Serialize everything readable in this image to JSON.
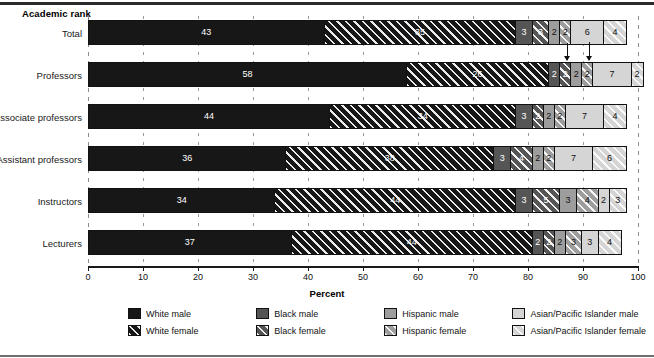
{
  "axis_title": "Academic rank",
  "x_axis": {
    "title": "Percent",
    "ticks": [
      0,
      10,
      20,
      30,
      40,
      50,
      60,
      70,
      80,
      90,
      100
    ]
  },
  "legend": {
    "items": [
      {
        "label": "White male",
        "key": "wm"
      },
      {
        "label": "Black male",
        "key": "bm"
      },
      {
        "label": "Hispanic male",
        "key": "hm"
      },
      {
        "label": "Asian/Pacific Islander male",
        "key": "am"
      },
      {
        "label": "White female",
        "key": "wf"
      },
      {
        "label": "Black female",
        "key": "bf"
      },
      {
        "label": "Hispanic female",
        "key": "hf"
      },
      {
        "label": "Asian/Pacific Islander female",
        "key": "af"
      }
    ]
  },
  "chart_data": {
    "type": "bar",
    "orientation": "horizontal",
    "stacked": true,
    "title": "",
    "xlabel": "Percent",
    "ylabel": "Academic rank",
    "xlim": [
      0,
      100
    ],
    "grid": true,
    "legend_position": "bottom",
    "categories": [
      "Total",
      "Professors",
      "Associate professors",
      "Assistant professors",
      "Instructors",
      "Lecturers"
    ],
    "series": [
      {
        "name": "White male",
        "key": "wm",
        "values": [
          43,
          58,
          44,
          36,
          34,
          37
        ]
      },
      {
        "name": "White female",
        "key": "wf",
        "values": [
          35,
          26,
          34,
          38,
          44,
          44
        ]
      },
      {
        "name": "Black male",
        "key": "bm",
        "values": [
          3,
          2,
          3,
          3,
          3,
          2
        ]
      },
      {
        "name": "Black female",
        "key": "bf",
        "values": [
          3,
          2,
          2,
          4,
          5,
          2
        ]
      },
      {
        "name": "Hispanic male",
        "key": "hm",
        "values": [
          2,
          2,
          2,
          2,
          3,
          2
        ]
      },
      {
        "name": "Hispanic female",
        "key": "hf",
        "values": [
          2,
          2,
          2,
          2,
          4,
          3
        ]
      },
      {
        "name": "Asian/Pacific Islander male",
        "key": "am",
        "values": [
          6,
          7,
          7,
          7,
          2,
          3
        ]
      },
      {
        "name": "Asian/Pacific Islander female",
        "key": "af",
        "values": [
          4,
          2,
          4,
          6,
          3,
          4
        ]
      }
    ],
    "annotations": [
      {
        "type": "arrow",
        "target_row": "Professors",
        "target_series": "Black female",
        "note": "points to narrow Black female segment"
      },
      {
        "type": "arrow",
        "target_row": "Professors",
        "target_series": "Hispanic female",
        "note": "points to narrow Hispanic female segment"
      }
    ]
  }
}
